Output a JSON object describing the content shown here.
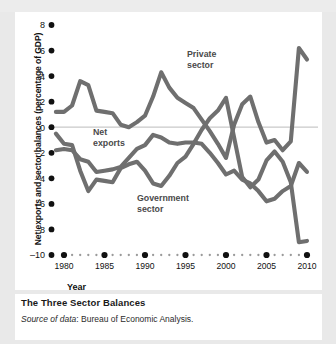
{
  "figure": {
    "caption_title": "The Three Sector Balances",
    "source_prefix": "Source of data",
    "source_text": ": Bureau of Economic Analysis.",
    "background": "#e9e9e9",
    "panel_background": "#ffffff",
    "line_color": "#6f6f6f",
    "gridline_color": "#c9c9c9"
  },
  "chart_data": {
    "type": "line",
    "title": "The Three Sector Balances",
    "xlabel": "Year",
    "ylabel": "Net exports and sector balances (percentage of GDP)",
    "xlim": [
      1979,
      2010.5
    ],
    "ylim": [
      -10,
      8
    ],
    "yticks": [
      8,
      6,
      4,
      2,
      0,
      -2,
      -4,
      -6,
      -8,
      -10
    ],
    "ytick_labels": [
      "8",
      "6",
      "4",
      "2",
      "0",
      "-2",
      "-4",
      "-6",
      "-8",
      "-10"
    ],
    "xticks": [
      1980,
      1985,
      1990,
      1995,
      2000,
      2005,
      2010
    ],
    "xtick_labels": [
      "1980",
      "1985",
      "1990",
      "1995",
      "2000",
      "2005",
      "2010"
    ],
    "minor_xticks_every": 1,
    "grid": "zero-line-only",
    "legend": "inline-annotations",
    "x": [
      1979,
      1980,
      1981,
      1982,
      1983,
      1984,
      1985,
      1986,
      1987,
      1988,
      1989,
      1990,
      1991,
      1992,
      1993,
      1994,
      1995,
      1996,
      1997,
      1998,
      1999,
      2000,
      2001,
      2002,
      2003,
      2004,
      2005,
      2006,
      2007,
      2008,
      2009,
      2010
    ],
    "series": [
      {
        "name": "Private sector",
        "label": "Private\nsector",
        "label_line1": "Private",
        "label_line2": "sector",
        "values": [
          1.2,
          1.2,
          1.7,
          3.6,
          3.3,
          1.3,
          1.2,
          1.1,
          0.2,
          0.0,
          0.4,
          0.9,
          2.4,
          4.3,
          3.1,
          2.3,
          1.9,
          1.5,
          0.6,
          -0.3,
          -1.3,
          -2.4,
          0.2,
          1.8,
          2.4,
          0.4,
          -1.2,
          -1.0,
          -1.8,
          -1.1,
          6.2,
          5.3
        ]
      },
      {
        "name": "Government sector",
        "label": "Government\nsector",
        "label_line1": "Government",
        "label_line2": "sector",
        "values": [
          -0.5,
          -1.3,
          -1.4,
          -3.4,
          -5.0,
          -4.1,
          -4.2,
          -4.3,
          -3.2,
          -2.9,
          -2.7,
          -3.4,
          -4.4,
          -4.6,
          -3.8,
          -2.8,
          -2.3,
          -1.3,
          -0.2,
          0.7,
          1.3,
          2.3,
          -0.8,
          -3.9,
          -4.7,
          -4.1,
          -2.6,
          -1.9,
          -2.7,
          -4.3,
          -9.0,
          -8.9
        ]
      },
      {
        "name": "Net exports",
        "label": "Net\nexports",
        "label_line1": "Net",
        "label_line2": "exports",
        "values": [
          -1.8,
          -1.7,
          -1.8,
          -2.5,
          -2.7,
          -3.5,
          -3.4,
          -3.3,
          -3.1,
          -2.4,
          -1.7,
          -1.4,
          -0.6,
          -0.8,
          -1.2,
          -1.3,
          -1.2,
          -1.2,
          -1.3,
          -2.0,
          -2.8,
          -3.7,
          -3.4,
          -4.1,
          -4.4,
          -5.0,
          -5.8,
          -5.6,
          -5.0,
          -4.6,
          -2.8,
          -3.5
        ]
      }
    ],
    "annotations": [
      {
        "text": "Private sector",
        "near_x": 1993,
        "near_y": 5.2
      },
      {
        "text": "Net exports",
        "near_x": 1984,
        "near_y": -0.7
      },
      {
        "text": "Government sector",
        "near_x": 1991,
        "near_y": -6.2
      }
    ]
  }
}
